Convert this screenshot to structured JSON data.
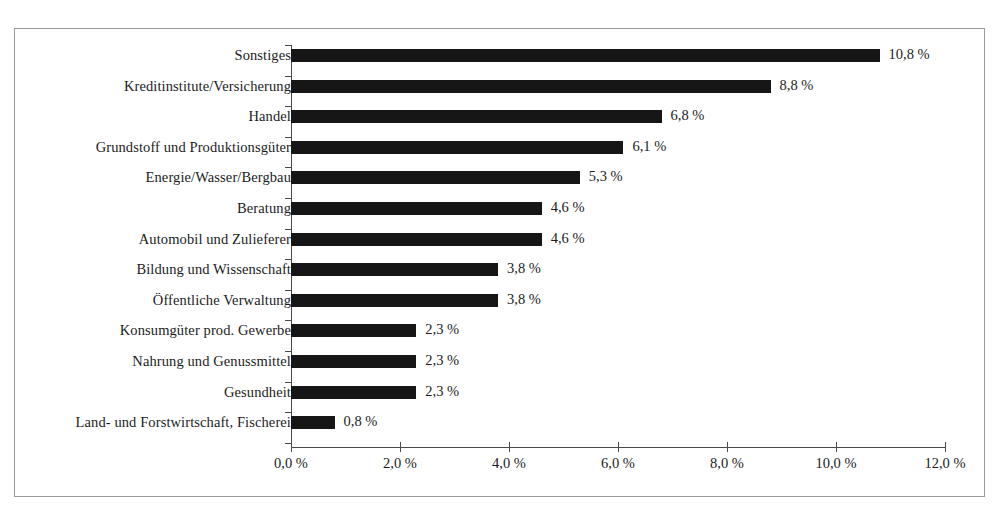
{
  "chart_data": {
    "type": "bar",
    "orientation": "horizontal",
    "title": "",
    "xlabel": "",
    "ylabel": "",
    "xlim": [
      0,
      12
    ],
    "grid": false,
    "legend": false,
    "bar_color": "#161616",
    "frame_color": "#9a9a9a",
    "axis_color": "#4a4a4a",
    "decimal_separator": ",",
    "unit": "%",
    "xticks": [
      0,
      2,
      4,
      6,
      8,
      10,
      12
    ],
    "xtick_labels": [
      "0,0 %",
      "2,0 %",
      "4,0 %",
      "6,0 %",
      "8,0 %",
      "10,0 %",
      "12,0 %"
    ],
    "categories": [
      "Sonstiges",
      "Kreditinstitute/Versicherung",
      "Handel",
      "Grundstoff und Produktionsgüter",
      "Energie/Wasser/Bergbau",
      "Beratung",
      "Automobil und Zulieferer",
      "Bildung und Wissenschaft",
      "Öffentliche Verwaltung",
      "Konsumgüter prod. Gewerbe",
      "Nahrung und Genussmittel",
      "Gesundheit",
      "Land- und Forstwirtschaft, Fischerei"
    ],
    "values": [
      10.8,
      8.8,
      6.8,
      6.1,
      5.3,
      4.6,
      4.6,
      3.8,
      3.8,
      2.3,
      2.3,
      2.3,
      0.8
    ],
    "value_labels": [
      "10,8 %",
      "8,8 %",
      "6,8 %",
      "6,1 %",
      "5,3 %",
      "4,6 %",
      "4,6 %",
      "3,8 %",
      "3,8 %",
      "2,3 %",
      "2,3 %",
      "2,3 %",
      "0,8 %"
    ]
  }
}
